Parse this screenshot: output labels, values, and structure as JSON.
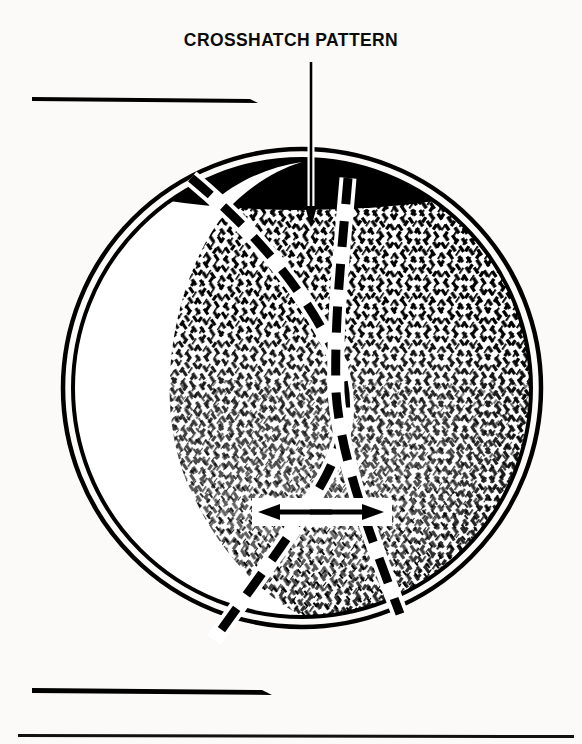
{
  "figure": {
    "title": "CROSSHATCH PATTERN",
    "background_color": "#fbfaf8",
    "ink_color": "#000000"
  },
  "callout": {
    "label": "CROSSHATCH PATTERN",
    "leader_line": {
      "from_x": 311,
      "from_y": 62,
      "to_x": 311,
      "to_y": 224,
      "arrowhead": "down"
    }
  },
  "bore": {
    "center_x": 302,
    "center_y": 388,
    "outer_radius": 240,
    "inner_radius": 230,
    "wall_style": "double-line-ring",
    "shadow_cap_label": "solid black upper bore shadow",
    "highlight_label": "white crescent highlight on left bore wall"
  },
  "deck_lines": [
    {
      "name": "upper-deck-line",
      "x1": 32,
      "y1": 98,
      "x2": 250,
      "y2": 99
    },
    {
      "name": "lower-deck-line",
      "x1": 32,
      "y1": 690,
      "x2": 266,
      "y2": 691
    }
  ],
  "page_rule": {
    "name": "page-bottom-rule",
    "x1": 18,
    "y1": 735,
    "x2": 574,
    "y2": 737
  },
  "hone_marks": {
    "description": "two opposing families of short diagonal strokes forming the crosshatch hone finish",
    "angle_right_deg": 35,
    "angle_left_deg": -35,
    "density": "dense at top and right, sparse and flecked at bottom"
  },
  "dashed_paths": [
    {
      "name": "left-hone-stroke-path",
      "direction": "down-right then down-left",
      "points": [
        [
          191,
          178
        ],
        [
          244,
          222
        ],
        [
          286,
          268
        ],
        [
          316,
          320
        ],
        [
          338,
          372
        ],
        [
          348,
          416
        ],
        [
          330,
          470
        ],
        [
          300,
          520
        ],
        [
          262,
          572
        ],
        [
          228,
          618
        ],
        [
          214,
          640
        ]
      ]
    },
    {
      "name": "right-hone-stroke-path",
      "direction": "down then down-right",
      "points": [
        [
          348,
          178
        ],
        [
          346,
          232
        ],
        [
          342,
          286
        ],
        [
          338,
          340
        ],
        [
          336,
          392
        ],
        [
          344,
          440
        ],
        [
          358,
          490
        ],
        [
          374,
          538
        ],
        [
          390,
          582
        ],
        [
          400,
          614
        ]
      ]
    }
  ],
  "angle_arrows": {
    "name": "crosshatch-angle-arrows",
    "y": 512,
    "left_arrow": {
      "tip_x": 262,
      "tail_x": 330
    },
    "right_arrow": {
      "tip_x": 380,
      "tail_x": 312
    }
  }
}
